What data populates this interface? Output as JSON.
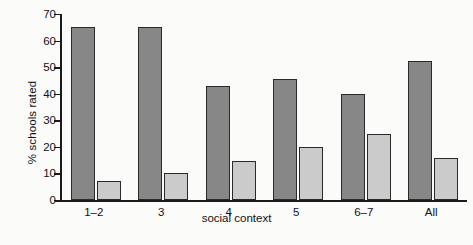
{
  "chart_data": {
    "type": "bar",
    "title": "",
    "subtitle": "",
    "xlabel": "social context",
    "ylabel": "% schools rated",
    "categories": [
      "1–2",
      "3",
      "4",
      "5",
      "6–7",
      "All"
    ],
    "series": [
      {
        "name": "dark",
        "color": "#878787",
        "values": [
          65,
          65,
          43,
          45.5,
          40,
          52.5
        ]
      },
      {
        "name": "light",
        "color": "#cbcbcb",
        "values": [
          7,
          10,
          14.5,
          20,
          25,
          16
        ]
      }
    ],
    "ylim": [
      0,
      70
    ],
    "yticks": [
      0,
      10,
      20,
      30,
      40,
      50,
      60,
      70
    ],
    "ytick_labels": [
      "0",
      "10",
      "20",
      "30",
      "40",
      "50",
      "60",
      "70"
    ],
    "grid": false,
    "legend": "none",
    "background_color": "#fbfbfa",
    "axis_color": "#1a1a1a",
    "bar_edge_color": "#2a2a2a"
  }
}
